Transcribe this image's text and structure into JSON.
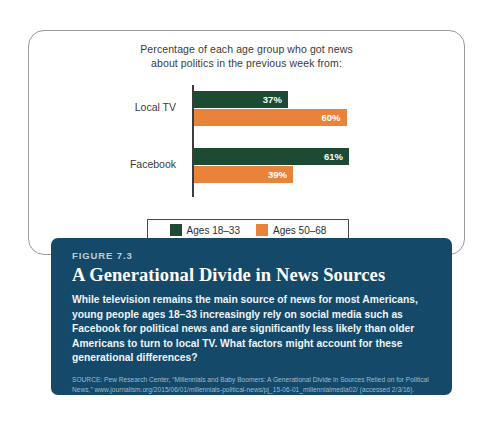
{
  "chart_data": {
    "type": "bar",
    "orientation": "horizontal",
    "title": "Percentage of each age group who got news about politics in the previous week from:",
    "title_lines": [
      "Percentage of each age group who got news",
      "about politics in the previous week from:"
    ],
    "categories": [
      "Local TV",
      "Facebook"
    ],
    "series": [
      {
        "name": "Ages 18–33",
        "color": "#1d4a32",
        "values": [
          37,
          61
        ],
        "labels": [
          "37%",
          "61%"
        ]
      },
      {
        "name": "Ages 50–68",
        "color": "#e8833a",
        "values": [
          60,
          39
        ],
        "labels": [
          "60%",
          "39%"
        ]
      }
    ],
    "xlabel": "",
    "ylabel": "",
    "xlim": [
      0,
      100
    ],
    "grid": false,
    "legend_position": "bottom"
  },
  "legend": {
    "items": [
      {
        "label": "Ages 18–33",
        "color": "#1d4a32"
      },
      {
        "label": "Ages 50–68",
        "color": "#e8833a"
      }
    ]
  },
  "caption": {
    "figure_number": "FIGURE 7.3",
    "heading": "A Generational Divide in News Sources",
    "body": "While television remains the main source of news for most Americans, young people ages 18–33 increasingly rely on social media such as Facebook for political news and are significantly less likely than older Americans to turn to local TV. What factors might account for these generational differences?",
    "source": "SOURCE: Pew Research Center, “Millennials and Baby Boomers: A Generational Divide in Sources Relied on for Political News,” www.journalism.org/2015/06/01/millennials-political-news/pj_15-06-01_millennialmedia02/ (accessed 2/3/16)."
  },
  "colors": {
    "panel_navy": "#15496a",
    "series_young_green": "#1d4a32",
    "series_older_orange": "#e8833a",
    "card_border": "#9a9a9a"
  }
}
